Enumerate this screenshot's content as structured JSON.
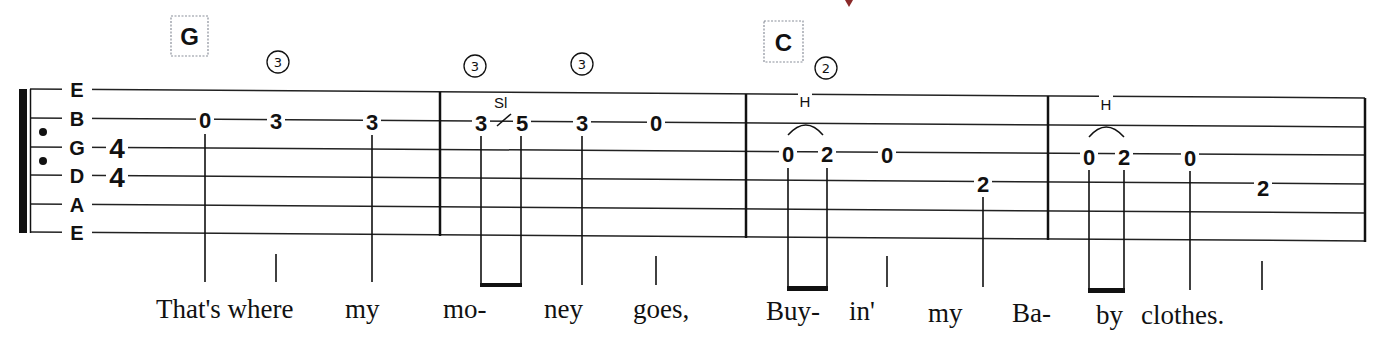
{
  "tab": {
    "string_labels": [
      "E",
      "B",
      "G",
      "D",
      "A",
      "E"
    ],
    "time_signature": {
      "top": "4",
      "bottom": "4"
    },
    "chords": [
      {
        "name": "G",
        "measure": 1
      },
      {
        "name": "C",
        "measure": 3
      }
    ],
    "string_indicators": [
      "3",
      "3",
      "3",
      "2"
    ],
    "string_indicator_glyphs": [
      "③",
      "③",
      "③",
      "②"
    ],
    "techniques": {
      "slide": "Sl",
      "hammer_on_1": "H",
      "hammer_on_2": "H"
    },
    "measures": [
      {
        "notes": [
          {
            "string": "B",
            "fret": "0"
          },
          {
            "string": "B",
            "fret": "3"
          },
          {
            "string": "B",
            "fret": "3"
          }
        ]
      },
      {
        "notes": [
          {
            "string": "B",
            "fret": "3"
          },
          {
            "string": "B",
            "fret": "5"
          },
          {
            "string": "B",
            "fret": "3"
          },
          {
            "string": "B",
            "fret": "0"
          }
        ]
      },
      {
        "notes": [
          {
            "string": "G",
            "fret": "0"
          },
          {
            "string": "G",
            "fret": "2"
          },
          {
            "string": "G",
            "fret": "0"
          },
          {
            "string": "D",
            "fret": "2"
          }
        ]
      },
      {
        "notes": [
          {
            "string": "G",
            "fret": "0"
          },
          {
            "string": "G",
            "fret": "2"
          },
          {
            "string": "G",
            "fret": "0"
          },
          {
            "string": "D",
            "fret": "2"
          }
        ]
      }
    ],
    "lyrics": [
      "That's where",
      "my",
      "mo-",
      "ney",
      "goes,",
      "Buy-",
      "in'",
      "my",
      "Ba-",
      "by",
      "clothes."
    ]
  },
  "colors": {
    "ink": "#111111",
    "chord_box_border": "#8a8f9a",
    "title_fragment": "#8b2a2a"
  }
}
